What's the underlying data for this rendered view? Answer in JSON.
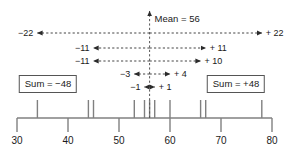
{
  "figure": {
    "mean_label": "Mean = 56",
    "mean_value": 56
  },
  "chart_data": {
    "type": "scatter",
    "xlabel": "",
    "ylabel": "",
    "xlim": [
      30,
      80
    ],
    "grid": false,
    "legend": null,
    "axis": {
      "ticks": [
        30,
        40,
        50,
        60,
        70,
        80
      ],
      "tick_labels": [
        "30",
        "40",
        "50",
        "60",
        "70",
        "80"
      ],
      "min": 30,
      "max": 80,
      "step": 10
    },
    "mean": 56,
    "mean_line_label": "Mean = 56",
    "data_points": [
      34,
      44,
      45,
      53,
      55,
      56,
      57,
      60,
      66,
      67,
      78
    ],
    "deviation_pairs": [
      {
        "left_label": "−22",
        "right_label": "+ 22",
        "left_value": -22,
        "right_value": 22,
        "left_x": 34,
        "right_x": 78
      },
      {
        "left_label": "−11",
        "right_label": "+ 11",
        "left_value": -11,
        "right_value": 11,
        "left_x": 45,
        "right_x": 67
      },
      {
        "left_label": "−11",
        "right_label": "+ 10",
        "left_value": -11,
        "right_value": 10,
        "left_x": 45,
        "right_x": 66
      },
      {
        "left_label": "−3",
        "right_label": "+ 4",
        "left_value": -3,
        "right_value": 4,
        "left_x": 53,
        "right_x": 60
      },
      {
        "left_label": "−1",
        "right_label": "+ 1",
        "left_value": -1,
        "right_value": 1,
        "left_x": 55,
        "right_x": 57
      }
    ],
    "annotations": [
      {
        "name": "sum-negative",
        "text": "Sum = −48",
        "value": -48
      },
      {
        "name": "sum-positive",
        "text": "Sum = +48",
        "value": 48
      }
    ]
  },
  "colors": {
    "ink": "#1a1a1a",
    "line": "#555555",
    "axis": "#808080",
    "box_border": "#555555",
    "background": "#ffffff"
  }
}
